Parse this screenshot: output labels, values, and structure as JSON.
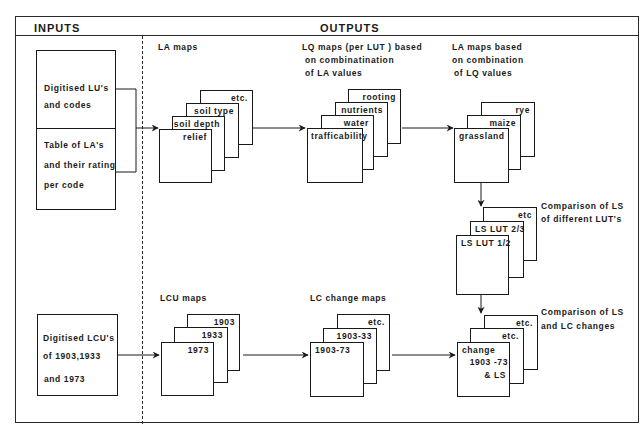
{
  "header": {
    "inputs_label": "INPUTS",
    "outputs_label": "OUTPUTS"
  },
  "inputs": {
    "lu_box": {
      "lines": [
        "Digitised LU's",
        "and codes"
      ]
    },
    "table_box": {
      "lines": [
        "Table of LA's",
        "and their rating",
        "per code"
      ]
    },
    "lcu_box": {
      "lines": [
        "Digitised LCU's",
        "of 1903,1933",
        "and 1973"
      ]
    }
  },
  "outputs": {
    "la_maps": {
      "caption": [
        "LA maps"
      ],
      "stack": [
        "relief",
        "soil depth",
        "soil type",
        "etc."
      ]
    },
    "lq_maps": {
      "caption": [
        "LQ maps (per LUT ) based",
        "on combinatination",
        "of LA values"
      ],
      "stack": [
        "trafficability",
        "water",
        "nutrients",
        "rooting"
      ]
    },
    "la_based": {
      "caption": [
        "LA maps based",
        "on combination",
        "of LQ values"
      ],
      "stack": [
        "grassland",
        "maize",
        "rye"
      ]
    },
    "ls_compare": {
      "caption": [
        "Comparison of LS",
        "of different LUT's"
      ],
      "stack": [
        "LS LUT 1/2",
        "LS LUT 2/3",
        "etc"
      ]
    },
    "lcu_maps": {
      "caption": [
        "LCU maps"
      ],
      "stack": [
        "1973",
        "1933",
        "1903"
      ]
    },
    "lc_change": {
      "caption": [
        "LC change maps"
      ],
      "stack": [
        "1903-73",
        "1903-33",
        "etc."
      ]
    },
    "ls_lc_compare": {
      "caption": [
        "Comparison of LS",
        "and LC changes"
      ],
      "stack": [
        "change",
        "1903 -73",
        "& LS",
        "etc.",
        "etc."
      ]
    }
  },
  "colors": {
    "line": "#1a1a1a",
    "background": "#ffffff"
  }
}
